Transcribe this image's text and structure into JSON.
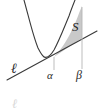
{
  "figure": {
    "kind": "math-diagram",
    "background_color": "#ffffff",
    "curve_color": "#3a3a3a",
    "line_color": "#3a3a3a",
    "shade_fill": "#c9c9c9",
    "shade_stroke": "#8a8a8a",
    "dashed_color": "#b5b5b5",
    "label_color": "#2b2b2b",
    "labels": {
      "region": "S",
      "line": "ℓ",
      "left_bound": "α",
      "right_bound": "β",
      "partial_glyph": "ℓ"
    },
    "geometry": {
      "parabola_vertex": [
        45,
        57
      ],
      "parabola_start": [
        24,
        0
      ],
      "parabola_end": [
        79,
        0
      ],
      "line_start": [
        7,
        80
      ],
      "line_end": [
        97,
        31
      ],
      "tangent_point": [
        54,
        57
      ],
      "alpha_x": 54,
      "beta_x": 82,
      "dashed_alpha": [
        54,
        57,
        54,
        70
      ],
      "dashed_beta": [
        82,
        38,
        82,
        69
      ]
    }
  }
}
